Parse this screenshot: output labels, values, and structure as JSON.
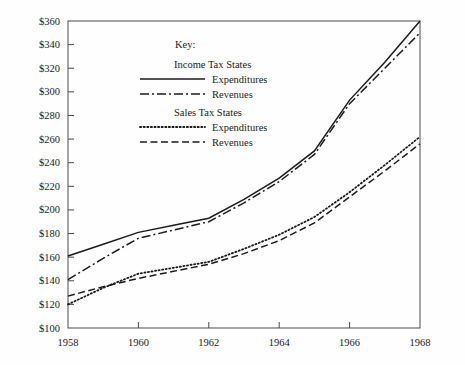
{
  "chart_data": {
    "type": "line",
    "title": "",
    "xlabel": "",
    "ylabel": "",
    "xlim": [
      1958,
      1968
    ],
    "ylim": [
      100,
      360
    ],
    "grid": false,
    "legend_position": "upper-left-inside",
    "legend_title": "Key:",
    "legend_groups": [
      {
        "group_label": "Income Tax States",
        "entries": [
          {
            "label": "Expenditures",
            "style": "solid"
          },
          {
            "label": "Revenues",
            "style": "dash-dot"
          }
        ]
      },
      {
        "group_label": "Sales Tax States",
        "entries": [
          {
            "label": "Expenditures",
            "style": "dotted"
          },
          {
            "label": "Revenues",
            "style": "dashed"
          }
        ]
      }
    ],
    "x": [
      1958,
      1959,
      1960,
      1961,
      1962,
      1963,
      1964,
      1965,
      1966,
      1967,
      1968
    ],
    "xticks": [
      1958,
      1960,
      1962,
      1964,
      1966,
      1968
    ],
    "xtick_labels": [
      "1958",
      "1960",
      "1962",
      "1964",
      "1966",
      "1968"
    ],
    "yticks": [
      100,
      120,
      140,
      160,
      180,
      200,
      220,
      240,
      260,
      280,
      300,
      320,
      340,
      360
    ],
    "ytick_labels": [
      "$100",
      "$120",
      "$140",
      "$160",
      "$180",
      "$200",
      "$220",
      "$240",
      "$260",
      "$280",
      "$300",
      "$320",
      "$340",
      "$360"
    ],
    "series": [
      {
        "name": "Income Tax States Expenditures",
        "style": "solid",
        "color": "#1b1b1b",
        "values": [
          161,
          171,
          181,
          187,
          193,
          209,
          227,
          250,
          293,
          325,
          360
        ]
      },
      {
        "name": "Income Tax States Revenues",
        "style": "dash-dot",
        "color": "#1b1b1b",
        "values": [
          141,
          159,
          176,
          183,
          190,
          206,
          224,
          247,
          290,
          320,
          350
        ]
      },
      {
        "name": "Sales Tax States Expenditures",
        "style": "dotted",
        "color": "#1b1b1b",
        "values": [
          120,
          134,
          146,
          151,
          156,
          167,
          179,
          194,
          215,
          238,
          262
        ]
      },
      {
        "name": "Sales Tax States Revenues",
        "style": "dashed",
        "color": "#1b1b1b",
        "values": [
          127,
          135,
          142,
          148,
          154,
          163,
          174,
          189,
          211,
          233,
          256
        ]
      }
    ]
  }
}
